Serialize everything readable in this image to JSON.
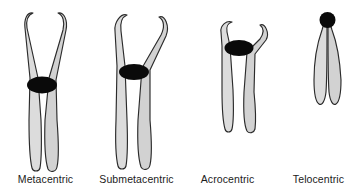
{
  "figure": {
    "background_color": "#ffffff",
    "arm_fill_color": "#dcdcdc",
    "arm_outline_color": "#2b2b2b",
    "centromere_color": "#0a0a0a",
    "label_color": "#1b1b1b"
  },
  "chromosomes": [
    {
      "label": "Metacentric",
      "centromere_shape": "ellipse",
      "centromere_position": "middle",
      "upper_arm_length": "long",
      "lower_arm_length": "long"
    },
    {
      "label": "Submetacentric",
      "centromere_shape": "ellipse",
      "centromere_position": "off-center",
      "upper_arm_length": "short",
      "lower_arm_length": "long"
    },
    {
      "label": "Acrocentric",
      "centromere_shape": "ellipse",
      "centromere_position": "near-end",
      "upper_arm_length": "very-short",
      "lower_arm_length": "long"
    },
    {
      "label": "Telocentric",
      "centromere_shape": "circle",
      "centromere_position": "terminal",
      "upper_arm_length": "none",
      "lower_arm_length": "long"
    }
  ]
}
